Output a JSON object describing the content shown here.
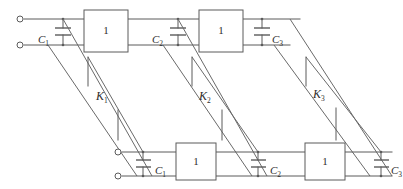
{
  "diagram": {
    "type": "circuit-schematic",
    "colors": {
      "wire": "#5b5b5b",
      "diagonal": "#6a6a6a",
      "background": "#ffffff",
      "text": "#2e2e2e"
    },
    "top_row": {
      "terminals": [
        {
          "name": "input-terminal-upper",
          "x": 20,
          "y": 19
        },
        {
          "name": "input-terminal-lower",
          "x": 20,
          "y": 45
        }
      ],
      "capacitors": [
        {
          "label": "C",
          "sub": "1",
          "x": 63,
          "label_side": "left"
        },
        {
          "label": "C",
          "sub": "2",
          "x": 162,
          "label_side": "left"
        },
        {
          "label": "C",
          "sub": "3",
          "x": 265,
          "label_side": "right"
        }
      ],
      "blocks": [
        {
          "label": "1",
          "x": 84,
          "y": 10,
          "w": 44,
          "h": 42
        },
        {
          "label": "1",
          "x": 199,
          "y": 10,
          "w": 44,
          "h": 42
        }
      ]
    },
    "bottom_row": {
      "terminals": [
        {
          "name": "output-terminal-upper",
          "x": 118,
          "y": 152
        },
        {
          "name": "output-terminal-lower",
          "x": 118,
          "y": 176
        }
      ],
      "capacitors": [
        {
          "label": "C",
          "sub": "1",
          "x": 143,
          "label_side": "right"
        },
        {
          "label": "C",
          "sub": "2",
          "x": 258,
          "label_side": "right"
        },
        {
          "label": "C",
          "sub": "3",
          "x": 381,
          "label_side": "right"
        }
      ],
      "blocks": [
        {
          "label": "1",
          "x": 176,
          "y": 143,
          "w": 40,
          "h": 37
        },
        {
          "label": "1",
          "x": 305,
          "y": 143,
          "w": 40,
          "h": 37
        }
      ]
    },
    "coupling_elements": [
      {
        "label": "K",
        "sub": "1",
        "x": 96,
        "y": 90
      },
      {
        "label": "K",
        "sub": "2",
        "x": 196,
        "y": 90
      },
      {
        "label": "K",
        "sub": "3",
        "x": 310,
        "y": 88
      }
    ],
    "block_gain_label": "1"
  }
}
